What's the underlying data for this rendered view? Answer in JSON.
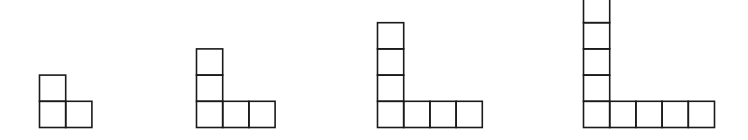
{
  "diagram": {
    "title": "",
    "stroke_color": "#1a1a1a",
    "background_color": "#ffffff",
    "figures": [
      {
        "step": 1,
        "vertical_squares_above_corner": 1,
        "horizontal_squares_right_of_corner": 1,
        "total_squares": 3
      },
      {
        "step": 2,
        "vertical_squares_above_corner": 2,
        "horizontal_squares_right_of_corner": 2,
        "total_squares": 5
      },
      {
        "step": 3,
        "vertical_squares_above_corner": 3,
        "horizontal_squares_right_of_corner": 3,
        "total_squares": 7
      },
      {
        "step": 4,
        "vertical_squares_above_corner": 4,
        "horizontal_squares_right_of_corner": 4,
        "total_squares": 9
      }
    ]
  }
}
